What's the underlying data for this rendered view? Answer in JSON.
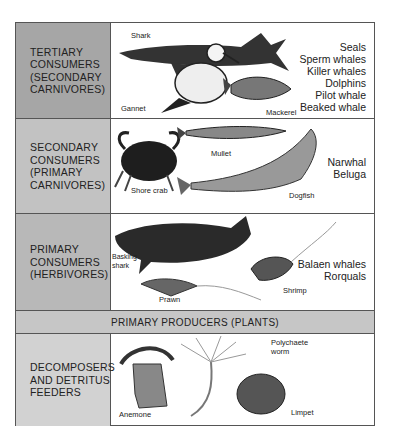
{
  "colors": {
    "tertiary_label_bg": "#a6a6a6",
    "secondary_label_bg": "#c2c2c2",
    "primary_label_bg": "#b8b8b8",
    "producers_bg": "#c6c6c6",
    "decomposers_label_bg": "#d2d2d2",
    "border": "#555555"
  },
  "rows": [
    {
      "label": "TERTIARY\nCONSUMERS\n(SECONDARY\nCARNIVORES)",
      "illustrated": [
        "Shark",
        "Gannet",
        "Mackerel"
      ],
      "examples": [
        "Seals",
        "Sperm  whales",
        "Killer  whales",
        "Dolphins",
        "Pilot  whale",
        "Beaked  whale"
      ]
    },
    {
      "label": "SECONDARY\nCONSUMERS\n(PRIMARY\nCARNIVORES)",
      "illustrated": [
        "Mullet",
        "Shore crab",
        "Dogfish"
      ],
      "examples": [
        "Narwhal",
        "Beluga"
      ]
    },
    {
      "label": "PRIMARY\nCONSUMERS\n(HERBIVORES)",
      "illustrated": [
        "Basking\nshark",
        "Shrimp",
        "Prawn"
      ],
      "examples": [
        "Balaen  whales",
        "Rorquals"
      ]
    },
    {
      "label": "PRIMARY PRODUCERS (PLANTS)"
    },
    {
      "label": "DECOMPOSERS\nAND DETRITUS\nFEEDERS",
      "illustrated": [
        "Polychaete\nworm",
        "Anemone",
        "Limpet"
      ]
    }
  ]
}
